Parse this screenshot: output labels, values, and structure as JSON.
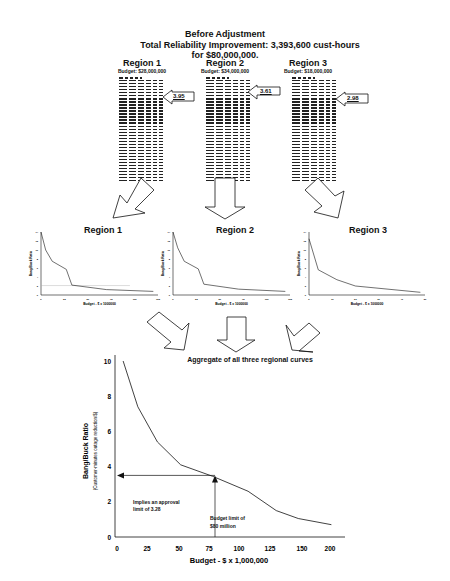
{
  "header": {
    "line1": "Before Adjustment",
    "line2": "Total Reliability Improvement: 3,393,600 cust-hours",
    "line3": "for $80,000,000."
  },
  "regions": [
    {
      "name": "Region 1",
      "budget": "Budget: $28,000,000",
      "marginal_ratio": "3.95"
    },
    {
      "name": "Region 2",
      "budget": "Budget: $34,000,000",
      "marginal_ratio": "3.61"
    },
    {
      "name": "Region 3",
      "budget": "Budget: $18,000,000",
      "marginal_ratio": "2.98"
    }
  ],
  "small_chart_common": {
    "ylabel": "Bang/Buck Ratio",
    "xlabel": "Budget - $ x 1000000"
  },
  "aggregate": {
    "title": "Aggregate of all three regional curves",
    "ylabel": "Bang/Buck Ratio",
    "ylabel_sub": "(Customer-minutes outage reduction/$)",
    "xlabel": "Budget - $ x 1,000,000",
    "annotation_approval_line1": "Implies an approval",
    "annotation_approval_line2": "limit of 3.28",
    "annotation_budget_line1": "Budget limit of",
    "annotation_budget_line2": "$80 million"
  },
  "chart_data": [
    {
      "type": "line",
      "title": "Region 1",
      "xlabel": "Budget - $ x 1000000",
      "ylabel": "Bang/Buck Ratio",
      "x_ticks": [
        "0",
        "25",
        "50",
        "75",
        "100",
        "125"
      ],
      "y_ticks": [
        "0",
        "2",
        "4",
        "6",
        "8",
        "10",
        "12",
        "14"
      ],
      "xlim": [
        0,
        125
      ],
      "ylim": [
        0,
        14
      ],
      "x": [
        0,
        5,
        12,
        27,
        33,
        70,
        120
      ],
      "y": [
        14,
        10,
        7.5,
        5.7,
        2.2,
        1.2,
        0.8
      ],
      "reference_line_y": 2.1
    },
    {
      "type": "line",
      "title": "Region 2",
      "xlabel": "Budget - $ x 1000000",
      "ylabel": "Bang/Buck Ratio",
      "x_ticks": [
        "0",
        "25",
        "50",
        "75",
        "100",
        "125"
      ],
      "y_ticks": [
        "0",
        "2",
        "4",
        "6",
        "8",
        "10",
        "12",
        "14"
      ],
      "xlim": [
        0,
        125
      ],
      "ylim": [
        0,
        14
      ],
      "x": [
        0,
        5,
        12,
        27,
        33,
        70,
        120
      ],
      "y": [
        14,
        10.5,
        7.5,
        5.8,
        2.4,
        1.3,
        0.8
      ]
    },
    {
      "type": "line",
      "title": "Region 3",
      "xlabel": "Budget - $ x 1000000",
      "ylabel": "Bang/Buck Ratio",
      "x_ticks": [
        "0",
        "10",
        "20",
        "30",
        "40",
        "50"
      ],
      "y_ticks": [
        "0",
        "2",
        "4",
        "6",
        "8",
        "10",
        "12",
        "14"
      ],
      "xlim": [
        0,
        50
      ],
      "ylim": [
        0,
        14
      ],
      "x": [
        0,
        4,
        12,
        20,
        48
      ],
      "y": [
        12.5,
        5.6,
        3.4,
        2.0,
        0.6
      ]
    },
    {
      "type": "line",
      "title": "Aggregate of all three regional curves",
      "xlabel": "Budget - $ x 1,000,000",
      "ylabel": "Bang/Buck Ratio (Customer-minutes outage reduction/$)",
      "x_ticks": [
        "0",
        "25",
        "50",
        "75",
        "100",
        "125",
        "150",
        "200"
      ],
      "y_ticks": [
        "0",
        "2",
        "4",
        "6",
        "8",
        "10"
      ],
      "ylim": [
        0,
        10
      ],
      "x": [
        5,
        17,
        33,
        52,
        78,
        107,
        130,
        148,
        175
      ],
      "y": [
        10,
        7.4,
        5.4,
        4.1,
        3.45,
        2.6,
        1.5,
        1.05,
        0.7
      ],
      "annotations": [
        {
          "text": "Implies an approval limit of 3.28",
          "y": 3.28
        },
        {
          "text": "Budget limit of $80 million",
          "x": 80
        }
      ]
    }
  ]
}
